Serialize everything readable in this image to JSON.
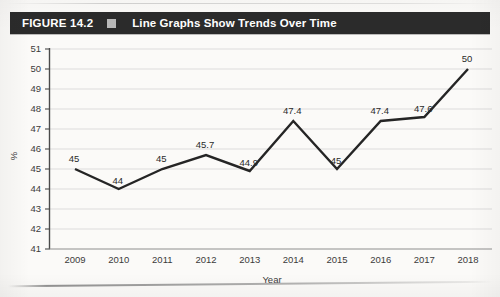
{
  "figure": {
    "label": "FIGURE 14.2",
    "separator_icon": "filled-square-icon",
    "title": "Line Graphs Show Trends Over Time",
    "banner_color": "#2b2b2b",
    "banner_text_color": "#ffffff"
  },
  "chart_data": {
    "type": "line",
    "title": "Line Graphs Show Trends Over Time",
    "xlabel": "Year",
    "ylabel": "%",
    "categories": [
      "2009",
      "2010",
      "2011",
      "2012",
      "2013",
      "2014",
      "2015",
      "2016",
      "2017",
      "2018"
    ],
    "values": [
      45,
      44,
      45,
      45.7,
      44.9,
      47.4,
      45,
      47.4,
      47.6,
      50
    ],
    "point_labels": [
      "45",
      "44",
      "45",
      "45.7",
      "44.9",
      "47.4",
      "45",
      "47.4",
      "47.6",
      "50"
    ],
    "ylim": [
      41,
      51
    ],
    "yticks": [
      41,
      42,
      43,
      44,
      45,
      46,
      47,
      48,
      49,
      50,
      51
    ],
    "ytick_labels": [
      "41",
      "42",
      "43",
      "44",
      "45",
      "46",
      "47",
      "48",
      "49",
      "50",
      "51"
    ],
    "grid": true,
    "grid_axis": "y",
    "legend": false,
    "line_color": "#252525",
    "grid_color": "#d9d9d9",
    "axis_color": "#4a4a4a"
  }
}
